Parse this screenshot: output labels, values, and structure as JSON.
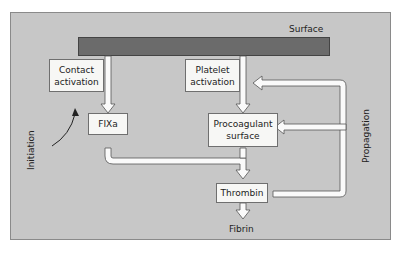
{
  "surface_label": "Surface",
  "boxes": {
    "contact": [
      "Contact",
      "activation"
    ],
    "platelet": [
      "Platelet",
      "activation"
    ],
    "fixa": "FIXa",
    "procoag": [
      "Procoagulant",
      "surface"
    ],
    "thrombin": "Thrombin"
  },
  "fibrin_label": "Fibrin",
  "initiation_label": "Initiation",
  "propagation_label": "Propagation",
  "colors": {
    "panel": "#c7c7c7",
    "surface_bar": "#6b6b6b",
    "box": "#f7f7f5",
    "arrow_fill": "#fafafa"
  }
}
